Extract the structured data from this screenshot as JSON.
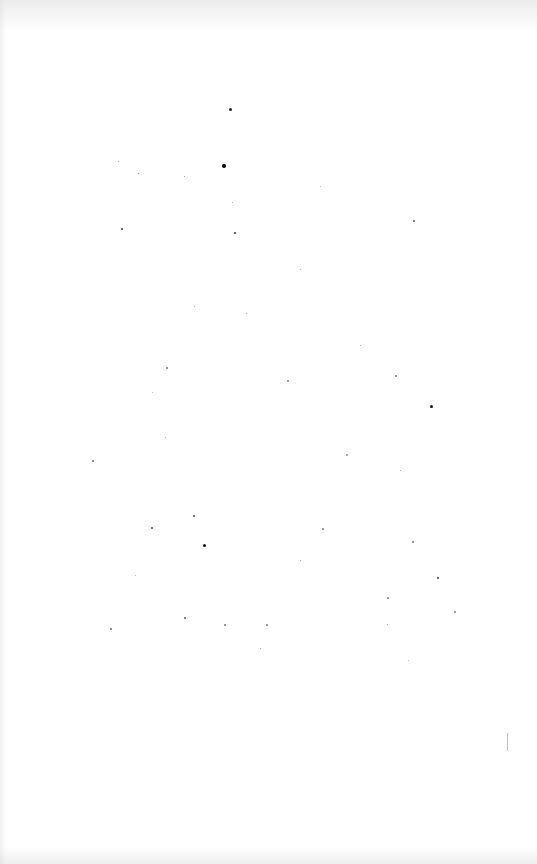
{
  "document": {
    "type": "blank-scanned-page",
    "width": 537,
    "height": 864,
    "background_color": "#ffffff",
    "text_content": []
  },
  "specks": [
    [
      229,
      108,
      3,
      "#222"
    ],
    [
      222,
      164,
      4,
      "#000"
    ],
    [
      121,
      228,
      2,
      "#333"
    ],
    [
      234,
      232,
      2,
      "#333"
    ],
    [
      413,
      220,
      2,
      "#555"
    ],
    [
      430,
      405,
      3,
      "#111"
    ],
    [
      203,
      544,
      3,
      "#111"
    ],
    [
      193,
      515,
      2,
      "#444"
    ],
    [
      151,
      527,
      2,
      "#444"
    ],
    [
      437,
      577,
      2,
      "#444"
    ],
    [
      454,
      611,
      2,
      "#777"
    ],
    [
      184,
      617,
      2,
      "#555"
    ],
    [
      110,
      628,
      2,
      "#666"
    ],
    [
      138,
      173,
      1,
      "#777"
    ],
    [
      118,
      161,
      1,
      "#888"
    ],
    [
      184,
      176,
      1,
      "#888"
    ],
    [
      166,
      367,
      2,
      "#666"
    ],
    [
      287,
      380,
      2,
      "#777"
    ],
    [
      92,
      460,
      2,
      "#666"
    ],
    [
      395,
      375,
      2,
      "#777"
    ],
    [
      266,
      624,
      2,
      "#777"
    ],
    [
      224,
      624,
      2,
      "#777"
    ],
    [
      387,
      597,
      2,
      "#777"
    ],
    [
      322,
      528,
      2,
      "#777"
    ],
    [
      412,
      541,
      2,
      "#777"
    ],
    [
      246,
      313,
      1,
      "#999"
    ],
    [
      300,
      269,
      1,
      "#999"
    ],
    [
      346,
      454,
      2,
      "#888"
    ],
    [
      387,
      624,
      1,
      "#999"
    ],
    [
      320,
      186,
      1,
      "#aaa"
    ],
    [
      194,
      306,
      1,
      "#999"
    ],
    [
      165,
      437,
      1,
      "#999"
    ],
    [
      135,
      575,
      1,
      "#999"
    ],
    [
      260,
      648,
      1,
      "#999"
    ],
    [
      408,
      660,
      1,
      "#aaa"
    ],
    [
      360,
      345,
      1,
      "#999"
    ],
    [
      400,
      470,
      1,
      "#999"
    ],
    [
      232,
      202,
      1,
      "#999"
    ],
    [
      152,
      392,
      1,
      "#aaa"
    ],
    [
      300,
      560,
      1,
      "#999"
    ]
  ]
}
